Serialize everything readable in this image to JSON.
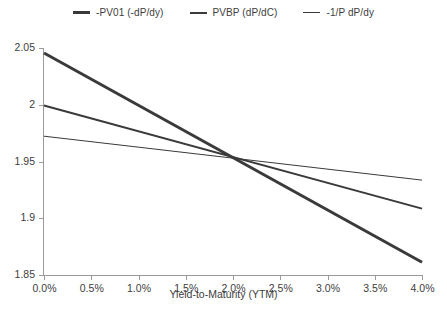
{
  "chart_data": {
    "type": "line",
    "title": "",
    "xlabel": "Yield-to-Maturity (YTM)",
    "ylabel": "",
    "xlim": [
      0.0,
      4.0
    ],
    "ylim": [
      1.85,
      2.05
    ],
    "grid": false,
    "legend_position": "top-center",
    "x_tick_labels": [
      "0.0%",
      "0.5%",
      "1.0%",
      "1.5%",
      "2.0%",
      "2.5%",
      "3.0%",
      "3.5%",
      "4.0%"
    ],
    "x_tick_values": [
      0.0,
      0.5,
      1.0,
      1.5,
      2.0,
      2.5,
      3.0,
      3.5,
      4.0
    ],
    "y_tick_labels": [
      "2.05",
      "2",
      "1.95",
      "1.9",
      "1.85"
    ],
    "y_tick_values": [
      2.05,
      2.0,
      1.95,
      1.9,
      1.85
    ],
    "x": [
      0.0,
      4.0
    ],
    "series": [
      {
        "name": "-PV01 (-dP/dy)",
        "color": "#3a3a3a",
        "width": 3,
        "values": [
          2.0456,
          1.8612
        ]
      },
      {
        "name": "PVBP (dP/dC)",
        "color": "#3a3a3a",
        "width": 2,
        "values": [
          1.9993,
          1.9085
        ]
      },
      {
        "name": "-1/P dP/dy",
        "color": "#3a3a3a",
        "width": 1,
        "values": [
          1.9723,
          1.9336
        ]
      }
    ],
    "crossing_point": {
      "x": 2.0,
      "y": 1.9504
    }
  },
  "legend": {
    "items": [
      {
        "label": "-PV01 (-dP/dy)"
      },
      {
        "label": "PVBP (dP/dC)"
      },
      {
        "label": "-1/P dP/dy"
      }
    ]
  },
  "axes": {
    "x_title": "Yield-to-Maturity (YTM)",
    "x_ticks": [
      {
        "label": "0.0%"
      },
      {
        "label": "0.5%"
      },
      {
        "label": "1.0%"
      },
      {
        "label": "1.5%"
      },
      {
        "label": "2.0%"
      },
      {
        "label": "2.5%"
      },
      {
        "label": "3.0%"
      },
      {
        "label": "3.5%"
      },
      {
        "label": "4.0%"
      }
    ],
    "y_ticks": [
      {
        "label": "2.05"
      },
      {
        "label": "2"
      },
      {
        "label": "1.95"
      },
      {
        "label": "1.9"
      },
      {
        "label": "1.85"
      }
    ]
  },
  "colors": {
    "line": "#3a3a3a",
    "axis": "#9a9a9a",
    "text": "#3d3d3d",
    "background": "#ffffff"
  }
}
